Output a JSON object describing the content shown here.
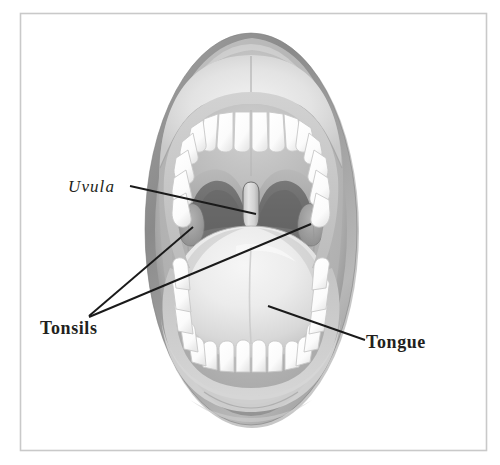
{
  "figure": {
    "style": "grayscale medical illustration",
    "frame": {
      "border_color": "#c9c9c9",
      "background_color": "#ffffff"
    }
  },
  "palette": {
    "background": "#ffffff",
    "frame_border": "#c9c9c9",
    "lip_outer": "#8d8d8d",
    "lip_mid": "#a8a8a8",
    "lip_inner_light": "#e2e2e2",
    "oral_cavity": "#b4b4b4",
    "palate": "#bdbdbd",
    "throat_dark": "#6f6f6f",
    "throat_darkest": "#5d5d5d",
    "tonsil": "#9a9a9a",
    "uvula": "#d6d6d6",
    "tongue_light": "#efefef",
    "tongue_mid": "#d3d3d3",
    "tongue_shadow": "#b9b9b9",
    "tooth_white": "#ffffff",
    "tooth_outline": "#c0c0c0",
    "gum": "#c6c6c6",
    "label_text": "#231f20",
    "leader_line": "#1a1a1a"
  },
  "labels": [
    {
      "id": "uvula",
      "text": "Uvula",
      "style": "italic",
      "text_x": 68,
      "text_y": 192,
      "leader": {
        "points": "130,186 256,214",
        "anchor_x": 256,
        "anchor_y": 214
      }
    },
    {
      "id": "tonsils",
      "text": "Tonsils",
      "style": "bold",
      "text_x": 40,
      "text_y": 334,
      "leader": {
        "points_left": "89,316 193,227",
        "points_right": "89,317 311,224",
        "apex_x": 89,
        "apex_y": 316
      }
    },
    {
      "id": "tongue",
      "text": "Tongue",
      "style": "bold",
      "text_x": 366,
      "text_y": 348,
      "leader": {
        "points": "268,306 365,340",
        "anchor_x": 268,
        "anchor_y": 306
      }
    }
  ],
  "anatomy_parts": [
    {
      "id": "upper-lip",
      "name": "Upper lip"
    },
    {
      "id": "lower-lip",
      "name": "Lower lip"
    },
    {
      "id": "upper-teeth",
      "name": "Upper teeth"
    },
    {
      "id": "lower-teeth",
      "name": "Lower teeth"
    },
    {
      "id": "hard-palate",
      "name": "Hard palate"
    },
    {
      "id": "soft-palate",
      "name": "Soft palate"
    },
    {
      "id": "oropharynx",
      "name": "Oropharynx (throat)"
    },
    {
      "id": "uvula",
      "name": "Uvula"
    },
    {
      "id": "left-tonsil",
      "name": "Left palatine tonsil"
    },
    {
      "id": "right-tonsil",
      "name": "Right palatine tonsil"
    },
    {
      "id": "tongue",
      "name": "Tongue"
    }
  ],
  "geometry": {
    "canvas_width": 500,
    "canvas_height": 465,
    "frame": {
      "x": 20,
      "y": 13,
      "width": 467,
      "height": 438
    },
    "mouth_oval": {
      "cx": 251,
      "cy": 229,
      "rx": 106,
      "ry": 196
    }
  }
}
